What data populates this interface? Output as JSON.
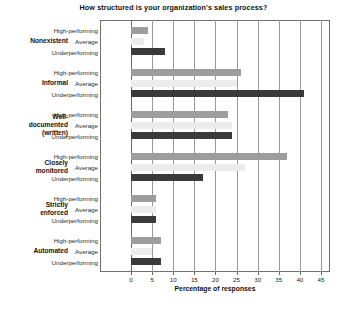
{
  "chart_data": {
    "type": "bar",
    "orientation": "horizontal",
    "title": "How structured is your organization's sales process?",
    "xlabel": "Percentage of responses",
    "ylabel": "",
    "xlim": [
      0,
      45
    ],
    "xticks": [
      0,
      5,
      10,
      15,
      20,
      25,
      30,
      35,
      40,
      45
    ],
    "xtick_labels": [
      "0",
      "5",
      "10",
      "15",
      "20",
      "25",
      "30",
      "35",
      "40",
      "45"
    ],
    "grid": true,
    "grid_axis": "x",
    "legend": "none",
    "categories": [
      "Nonexistent",
      "Informal",
      "Well-documented (written)",
      "Closely monitored",
      "Strictly enforced",
      "Automated"
    ],
    "series": [
      {
        "name": "High-performing",
        "color": "#9d9d9d",
        "values": [
          4,
          26,
          23,
          37,
          6,
          7
        ]
      },
      {
        "name": "Average",
        "color": "#ececec",
        "values": [
          3,
          25,
          24,
          27,
          6,
          5
        ]
      },
      {
        "name": "Underperforming",
        "color": "#3a3a3a",
        "values": [
          8,
          41,
          24,
          17,
          6,
          7
        ]
      }
    ]
  },
  "category_display": [
    [
      "Nonexistent"
    ],
    [
      "Informal"
    ],
    [
      "Well-",
      "documented",
      "(written)"
    ],
    [
      "Closely",
      "monitored"
    ],
    [
      "Strictly",
      "enforced"
    ],
    [
      "Automated"
    ]
  ]
}
